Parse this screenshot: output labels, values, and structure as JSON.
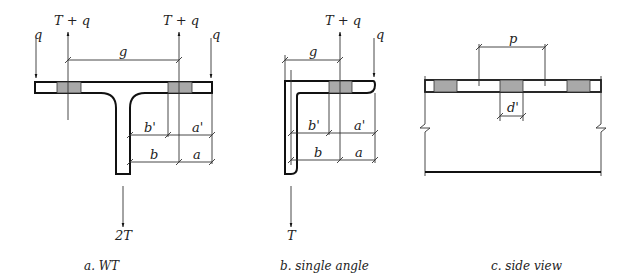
{
  "colors": {
    "line": "#111111",
    "hole_fill": "#a9a9a9",
    "background": "#ffffff"
  },
  "figures": {
    "wt": {
      "caption": "a. WT",
      "labels": {
        "load_left": "q",
        "load_right": "q",
        "tension_left": "T + q",
        "tension_right": "T + q",
        "gage": "g",
        "b_prime": "b'",
        "a_prime": "a'",
        "b": "b",
        "a": "a",
        "applied": "2T"
      }
    },
    "angle": {
      "caption": "b. single angle",
      "labels": {
        "tension": "T + q",
        "load": "q",
        "gage": "g",
        "b_prime": "b'",
        "a_prime": "a'",
        "b": "b",
        "a": "a",
        "applied": "T"
      }
    },
    "side": {
      "caption": "c. side view",
      "labels": {
        "pitch": "p",
        "hole_d": "d'"
      }
    }
  }
}
